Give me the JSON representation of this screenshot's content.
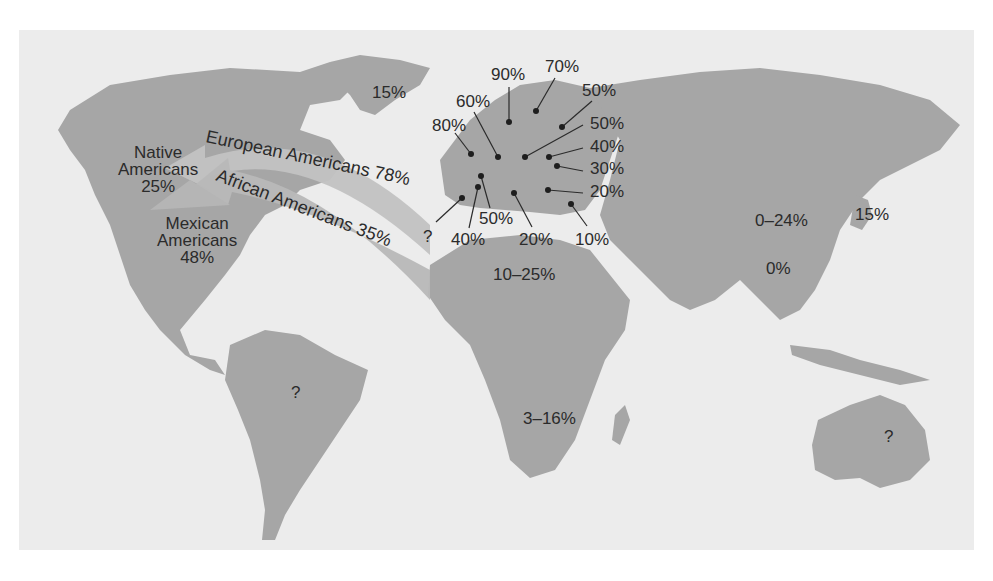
{
  "map": {
    "background_color": "#ececec",
    "land_color": "#a6a6a6",
    "arrow_color": "#bdbdbd",
    "text_color": "#2b2b2b"
  },
  "americas": {
    "native": {
      "line1": "Native",
      "line2": "Americans",
      "value": "25%"
    },
    "mexican": {
      "line1": "Mexican",
      "line2": "Americans",
      "value": "48%"
    },
    "european_arrow": "European Americans 78%",
    "african_arrow": "African Americans 35%",
    "south_america": "?"
  },
  "greenland": "15%",
  "europe": {
    "p90": "90%",
    "p70": "70%",
    "p60": "60%",
    "p50_ne": "50%",
    "p80": "80%",
    "p50_e": "50%",
    "p40_e": "40%",
    "p30_e": "30%",
    "p20_e": "20%",
    "p10_se": "10%",
    "p20_s": "20%",
    "p50_s": "50%",
    "p40_sw": "40%",
    "q_w": "?"
  },
  "africa": {
    "north": "10–25%",
    "south": "3–16%"
  },
  "asia": {
    "china": "0–24%",
    "southeast": "0%",
    "japan": "15%"
  },
  "australia": "?"
}
